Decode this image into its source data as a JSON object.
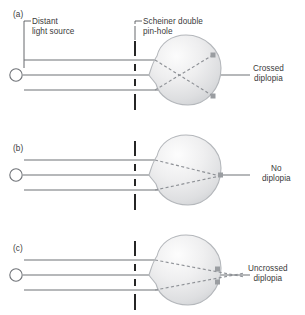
{
  "figure": {
    "type": "diagram",
    "background_color": "#ffffff",
    "text_color": "#3a3a3a",
    "ray_color": "#6f7277",
    "barrier_color": "#1b1b1b",
    "eye_outline_color": "#b4b7bb",
    "dashed_ray_color": "#8e9196",
    "marker_color": "#9a9da1"
  },
  "labels": {
    "distant_light_source": "Distant\nlight source",
    "scheiner_pinhole": "Scheiner double\npin-hole"
  },
  "panels": [
    {
      "id": "(a)",
      "centerline_y": 75,
      "result_label": "Crossed\ndiplopia",
      "condition": "crossed-diplopia",
      "focus": "rays cross before the retina",
      "retina_markers": 2
    },
    {
      "id": "(b)",
      "centerline_y": 175,
      "result_label": "No\ndiplopia",
      "condition": "no-diplopia",
      "focus": "rays converge exactly on the retina",
      "retina_markers": 1
    },
    {
      "id": "(c)",
      "centerline_y": 275,
      "result_label": "Uncrossed\ndiplopia",
      "condition": "uncrossed-diplopia",
      "focus": "rays converge behind the retina",
      "retina_markers": 2
    }
  ]
}
